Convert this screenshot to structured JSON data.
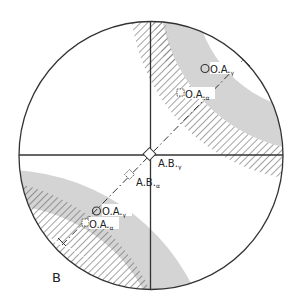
{
  "figure": {
    "panel_label": "B",
    "colors": {
      "outline": "#333333",
      "gray_band": "#d4d4d4",
      "hatch": "#555555",
      "background": "#ffffff"
    },
    "markers": {
      "center": {
        "label": "A.B.",
        "subscript": "γ",
        "shape": "diamond"
      },
      "center_alt": {
        "label": "A.B.",
        "subscript": "α",
        "shape": "dashed-diamond"
      },
      "upper_oa_gamma": {
        "label": "O.A.",
        "subscript": "γ",
        "shape": "circle"
      },
      "upper_oa_alpha": {
        "label": "O.A.",
        "subscript": "α",
        "shape": "dashed-square"
      },
      "lower_oa_gamma": {
        "label": "O.A.",
        "subscript": "γ",
        "shape": "circle"
      },
      "lower_oa_alpha": {
        "label": "O.A.",
        "subscript": "α",
        "shape": "dashed-square"
      }
    }
  }
}
